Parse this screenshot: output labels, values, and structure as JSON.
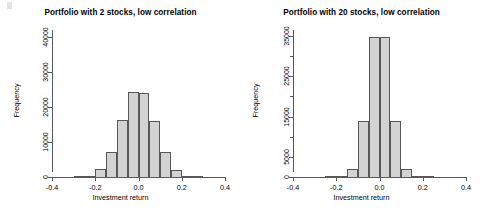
{
  "figure": {
    "background": "#ffffff",
    "bar_fill": "#d3d3d3",
    "bar_border": "#585858",
    "axis_color": "#555a5e"
  },
  "chart_data": [
    {
      "type": "bar",
      "title": "Portfolio with 2 stocks, low correlation",
      "xlabel": "Investment return",
      "ylabel": "Frequency",
      "grid": false,
      "legend": "none",
      "xlim": [
        -0.4,
        0.4
      ],
      "ylim": [
        0,
        42000
      ],
      "xticks": [
        "-0.4",
        "-0.2",
        "0.0",
        "0.2",
        "0.4"
      ],
      "xtick_values": [
        -0.4,
        -0.2,
        0.0,
        0.2,
        0.4
      ],
      "yticks": [
        "0",
        "10000",
        "20000",
        "30000",
        "40000"
      ],
      "ytick_values": [
        0,
        10000,
        20000,
        30000,
        40000
      ],
      "bin_width": 0.05,
      "bin_centers": [
        -0.275,
        -0.225,
        -0.175,
        -0.125,
        -0.075,
        -0.025,
        0.025,
        0.075,
        0.125,
        0.175,
        0.225,
        0.275
      ],
      "categories": [
        "-0.275",
        "-0.225",
        "-0.175",
        "-0.125",
        "-0.075",
        "-0.025",
        "0.025",
        "0.075",
        "0.125",
        "0.175",
        "0.225",
        "0.275"
      ],
      "values": [
        60,
        300,
        2200,
        7200,
        16200,
        24200,
        24100,
        16100,
        7100,
        2100,
        280,
        50
      ]
    },
    {
      "type": "bar",
      "title": "Portfolio with 20 stocks, low correlation",
      "xlabel": "Investment return",
      "ylabel": "Frequency",
      "grid": false,
      "legend": "none",
      "xlim": [
        -0.4,
        0.4
      ],
      "ylim": [
        0,
        36500
      ],
      "xticks": [
        "-0.4",
        "-0.2",
        "0.0",
        "0.2",
        "0.4"
      ],
      "xtick_values": [
        -0.4,
        -0.2,
        0.0,
        0.2,
        0.4
      ],
      "yticks": [
        "0",
        "5000",
        "15000",
        "25000",
        "35000"
      ],
      "ytick_values": [
        0,
        5000,
        15000,
        25000,
        35000
      ],
      "ytick_minor_values": [
        10000,
        20000,
        30000
      ],
      "bin_width": 0.05,
      "bin_centers": [
        -0.225,
        -0.175,
        -0.125,
        -0.075,
        -0.025,
        0.025,
        0.075,
        0.125,
        0.175,
        0.225
      ],
      "categories": [
        "-0.225",
        "-0.175",
        "-0.125",
        "-0.075",
        "-0.025",
        "0.025",
        "0.075",
        "0.125",
        "0.175",
        "0.225"
      ],
      "values": [
        40,
        180,
        2100,
        13900,
        34800,
        34700,
        13800,
        2050,
        170,
        35
      ]
    }
  ]
}
